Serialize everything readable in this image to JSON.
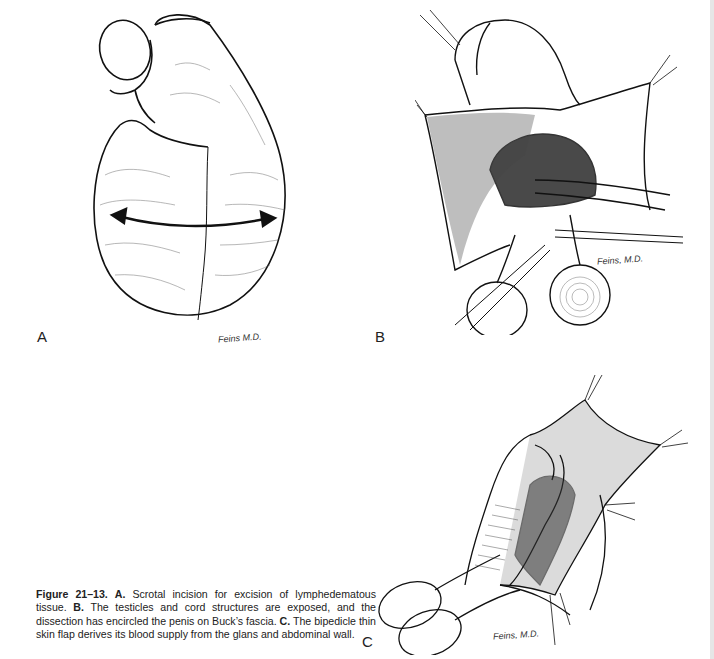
{
  "figure": {
    "number": "Figure 21–13.",
    "panels": [
      {
        "label": "A",
        "signature": "Feins M.D."
      },
      {
        "label": "B",
        "signature": "Feins, M.D."
      },
      {
        "label": "C",
        "signature": "Feins, M.D."
      }
    ],
    "caption": {
      "a_label": "A.",
      "a_text": " Scrotal incision for excision of lymphedematous tissue. ",
      "b_label": "B.",
      "b_text": " The testicles and cord structures are exposed, and the dissection has encircled the penis on Buck’s fascia. ",
      "c_label": "C.",
      "c_text": " The bipedicle thin skin flap derives its blood supply from the glans and abdominal wall."
    }
  }
}
